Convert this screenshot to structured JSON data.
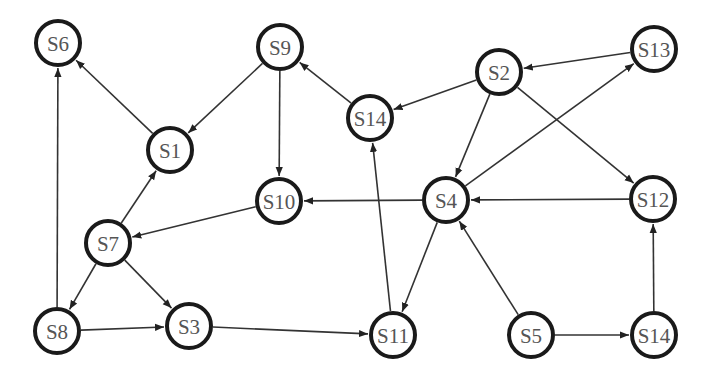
{
  "diagram": {
    "type": "directed-graph",
    "nodes": [
      {
        "id": "S6",
        "label": "S6",
        "x": 58,
        "y": 43
      },
      {
        "id": "S9",
        "label": "S9",
        "x": 280,
        "y": 47
      },
      {
        "id": "S14a",
        "label": "S14",
        "x": 370,
        "y": 118
      },
      {
        "id": "S2",
        "label": "S2",
        "x": 499,
        "y": 72
      },
      {
        "id": "S13",
        "label": "S13",
        "x": 654,
        "y": 49
      },
      {
        "id": "S1",
        "label": "S1",
        "x": 170,
        "y": 150
      },
      {
        "id": "S10",
        "label": "S10",
        "x": 279,
        "y": 201
      },
      {
        "id": "S4",
        "label": "S4",
        "x": 446,
        "y": 200
      },
      {
        "id": "S12",
        "label": "S12",
        "x": 653,
        "y": 199
      },
      {
        "id": "S7",
        "label": "S7",
        "x": 108,
        "y": 243
      },
      {
        "id": "S8",
        "label": "S8",
        "x": 57,
        "y": 331
      },
      {
        "id": "S3",
        "label": "S3",
        "x": 189,
        "y": 326
      },
      {
        "id": "S11",
        "label": "S11",
        "x": 393,
        "y": 335
      },
      {
        "id": "S5",
        "label": "S5",
        "x": 531,
        "y": 335
      },
      {
        "id": "S14b",
        "label": "S14",
        "x": 654,
        "y": 335
      }
    ],
    "edges": [
      {
        "from": "S1",
        "to": "S6"
      },
      {
        "from": "S8",
        "to": "S6"
      },
      {
        "from": "S9",
        "to": "S1"
      },
      {
        "from": "S9",
        "to": "S10"
      },
      {
        "from": "S14a",
        "to": "S9"
      },
      {
        "from": "S2",
        "to": "S14a"
      },
      {
        "from": "S13",
        "to": "S2"
      },
      {
        "from": "S2",
        "to": "S4"
      },
      {
        "from": "S2",
        "to": "S12"
      },
      {
        "from": "S4",
        "to": "S13"
      },
      {
        "from": "S12",
        "to": "S4"
      },
      {
        "from": "S4",
        "to": "S10"
      },
      {
        "from": "S4",
        "to": "S11"
      },
      {
        "from": "S5",
        "to": "S4"
      },
      {
        "from": "S5",
        "to": "S14b"
      },
      {
        "from": "S14b",
        "to": "S12"
      },
      {
        "from": "S11",
        "to": "S14a"
      },
      {
        "from": "S10",
        "to": "S7"
      },
      {
        "from": "S7",
        "to": "S1"
      },
      {
        "from": "S7",
        "to": "S8"
      },
      {
        "from": "S7",
        "to": "S3"
      },
      {
        "from": "S8",
        "to": "S3"
      },
      {
        "from": "S3",
        "to": "S11"
      }
    ],
    "style": {
      "node_radius": 22,
      "node_stroke": "#1a1a1a",
      "edge_color": "#333333",
      "label_color": "#555555",
      "background": "#ffffff"
    }
  }
}
